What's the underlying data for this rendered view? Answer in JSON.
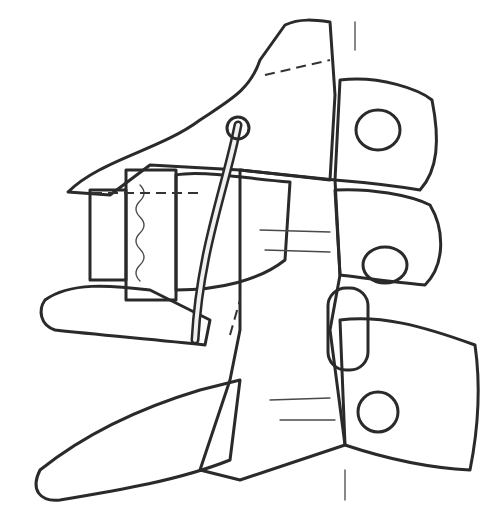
{
  "image": {
    "subject": "Pencil illustration of cervical spine vertebrae (lateral view) with interbody implant block and bone graft",
    "style": "grayscale pencil drawing",
    "colors": {
      "background": "#ffffff",
      "ink": "#2a2a2a",
      "bone_fill": "#e9e9e9",
      "shadow": "#bdbdbd",
      "graft": "#cfcfcf"
    },
    "labels": []
  }
}
